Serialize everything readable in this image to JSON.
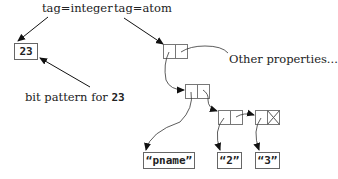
{
  "diagram": {
    "type": "lisp-atom-memory-layout",
    "labels": {
      "tag_integer": "tag=integer",
      "tag_atom": "tag=atom",
      "other_properties": "Other properties...",
      "bit_pattern_prefix": "bit pattern for ",
      "bit_pattern_value": "23"
    },
    "integer_box": {
      "value": "23"
    },
    "cons_cells": [
      {
        "id": "atom-cell",
        "car": "property-list",
        "cdr": "other-properties"
      },
      {
        "id": "plist-cell-1",
        "car": "pname-string",
        "cdr": "plist-cell-2"
      },
      {
        "id": "plist-cell-2",
        "car": "string-2",
        "cdr": "plist-cell-3"
      },
      {
        "id": "plist-cell-3",
        "car": "string-3",
        "cdr": "nil"
      }
    ],
    "strings": [
      {
        "id": "pname-string",
        "value": "“pname”"
      },
      {
        "id": "string-2",
        "value": "“2”"
      },
      {
        "id": "string-3",
        "value": "“3”"
      }
    ]
  }
}
